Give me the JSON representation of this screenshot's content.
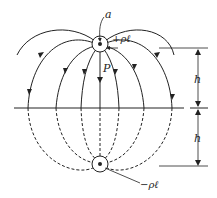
{
  "diagram": {
    "labels": {
      "radius": "a",
      "positive_charge": "+ρℓ",
      "negative_charge": "−ρℓ",
      "point": "P",
      "height_upper": "h",
      "height_lower": "h"
    },
    "colors": {
      "stroke": "#222222",
      "background": "#ffffff"
    }
  }
}
